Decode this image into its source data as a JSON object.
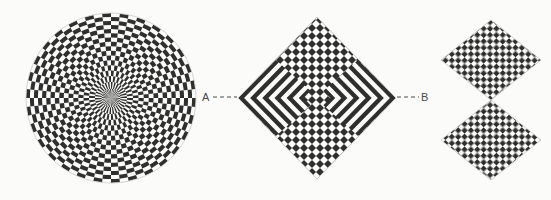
{
  "figure": {
    "background_color": "#fbfbfa",
    "ink_color": "#2f2f2f",
    "paper_color": "#fbfbfa",
    "width": 551,
    "height": 200
  },
  "labels": {
    "a": "A",
    "b": "B"
  },
  "panels": [
    {
      "id": "polar-checkerboard-disc",
      "kind": "disc",
      "center_x": 111,
      "center_y": 98,
      "radius": 85,
      "rings": 17,
      "sectors": 60
    },
    {
      "id": "concentric-diamond-checkerboard",
      "kind": "diamond",
      "center_x": 317,
      "center_y": 98,
      "half_width": 79,
      "half_height": 81,
      "bands": 13,
      "checker_cells": 26
    },
    {
      "id": "stacked-diamond-checkerboard",
      "kind": "double-diamond",
      "center_x": 491,
      "top_diamond_center_y": 60,
      "bottom_diamond_center_y": 140,
      "half_width": 50,
      "half_height": 40,
      "checker_cells": 14
    }
  ],
  "leaders": {
    "a_line": {
      "x1": 213,
      "y1": 97,
      "x2": 237,
      "y2": 97
    },
    "b_line": {
      "x1": 397,
      "y1": 97,
      "x2": 419,
      "y2": 97
    },
    "dash_pattern": "4 3"
  }
}
